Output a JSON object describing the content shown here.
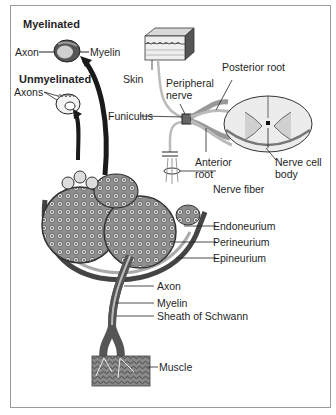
{
  "figure": {
    "title_myelinated": "Myelinated",
    "title_unmyelinated": "Unmyelinated",
    "labels": {
      "axon_top": "Axon",
      "myelin_top": "Myelin",
      "axons": "Axons",
      "skin": "Skin",
      "peripheral_nerve_1": "Peripheral",
      "peripheral_nerve_2": "nerve",
      "posterior_root": "Posterior root",
      "funiculus": "Funiculus",
      "anterior_root_1": "Anterior",
      "anterior_root_2": "root",
      "nerve_cell_body_1": "Nerve cell",
      "nerve_cell_body_2": "body",
      "nerve_fiber": "Nerve fiber",
      "endoneurium": "Endoneurium",
      "perineurium": "Perineurium",
      "epineurium": "Epineurium",
      "axon": "Axon",
      "myelin": "Myelin",
      "sheath_of_schwann": "Sheath of Schwann",
      "muscle": "Muscle"
    }
  }
}
